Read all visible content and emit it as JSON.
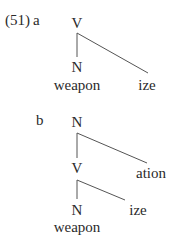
{
  "example": {
    "number": "(51)",
    "a": {
      "label": "a",
      "root": "V",
      "child": "N",
      "stem": "weapon",
      "suffix": "ize"
    },
    "b": {
      "label": "b",
      "root": "N",
      "mid": "V",
      "suffix_outer": "ation",
      "child": "N",
      "suffix_inner": "ize",
      "stem": "weapon"
    }
  },
  "colors": {
    "text": "#2a2a2a",
    "lines": "#555555",
    "background": "#ffffff"
  }
}
